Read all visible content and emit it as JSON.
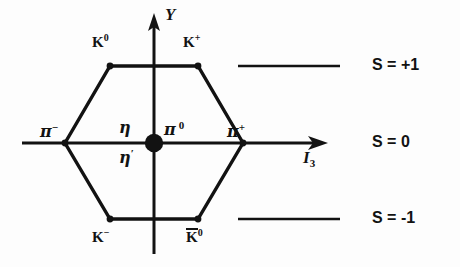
{
  "figure": {
    "axes": {
      "vertical_label": "Y",
      "horizontal_label_base": "I",
      "horizontal_label_sub": "3"
    },
    "particles": [
      {
        "key": "k0",
        "base": "K",
        "sup": "0",
        "overbar": false,
        "position": "upper-left",
        "label_x": 92,
        "label_y": 33
      },
      {
        "key": "kplus",
        "base": "K",
        "sup": "+",
        "overbar": false,
        "position": "upper-right",
        "label_x": 183,
        "label_y": 33
      },
      {
        "key": "piminus",
        "base": "π",
        "sup": "−",
        "overbar": false,
        "position": "left-vertex",
        "label_x": 40,
        "label_y": 123
      },
      {
        "key": "eta",
        "base": "η",
        "sup": "",
        "overbar": false,
        "position": "center-upper",
        "label_x": 119,
        "label_y": 122
      },
      {
        "key": "etaprime",
        "base": "η",
        "sup": "′",
        "overbar": false,
        "position": "center-lower",
        "label_x": 119,
        "label_y": 148
      },
      {
        "key": "pi0",
        "base": "π",
        "sup": "0",
        "overbar": false,
        "position": "center-right",
        "label_x": 163,
        "label_y": 122
      },
      {
        "key": "piplus",
        "base": "π",
        "sup": "+",
        "overbar": false,
        "position": "right-vertex",
        "label_x": 228,
        "label_y": 123
      },
      {
        "key": "kminus",
        "base": "K",
        "sup": "−",
        "overbar": false,
        "position": "lower-left",
        "label_x": 92,
        "label_y": 229
      },
      {
        "key": "k0bar",
        "base": "K",
        "sup": "0",
        "overbar": true,
        "position": "lower-right",
        "label_x": 186,
        "label_y": 228
      }
    ],
    "strangeness_levels": [
      {
        "key": "s-plus-1",
        "label": "S = +1",
        "line_y": 66,
        "line_x1": 238,
        "line_x2": 340,
        "label_x": 372,
        "label_y": 57
      },
      {
        "key": "s-zero",
        "label": "S = 0",
        "line_y": 143,
        "line_x1": 0,
        "line_x2": 0,
        "label_x": 372,
        "label_y": 134
      },
      {
        "key": "s-minus-1",
        "label": "S = -1",
        "line_y": 219,
        "line_x1": 238,
        "line_x2": 340,
        "label_x": 372,
        "label_y": 210
      }
    ],
    "geometry": {
      "hexagon_vertices": [
        {
          "name": "K0",
          "x": 110,
          "y": 66
        },
        {
          "name": "Kplus",
          "x": 198,
          "y": 66
        },
        {
          "name": "piplus",
          "x": 243,
          "y": 143
        },
        {
          "name": "K0bar",
          "x": 198,
          "y": 219
        },
        {
          "name": "Kminus",
          "x": 110,
          "y": 219
        },
        {
          "name": "piminus",
          "x": 65,
          "y": 143
        }
      ],
      "center_dot": {
        "x": 154,
        "y": 143,
        "r": 9
      },
      "x_axis": {
        "x1": 22,
        "x2": 326,
        "y": 143
      },
      "y_axis": {
        "x": 154,
        "y1": 16,
        "y2": 254
      }
    },
    "colors": {
      "ink": "#121212",
      "background": "#fdfdfd"
    }
  }
}
